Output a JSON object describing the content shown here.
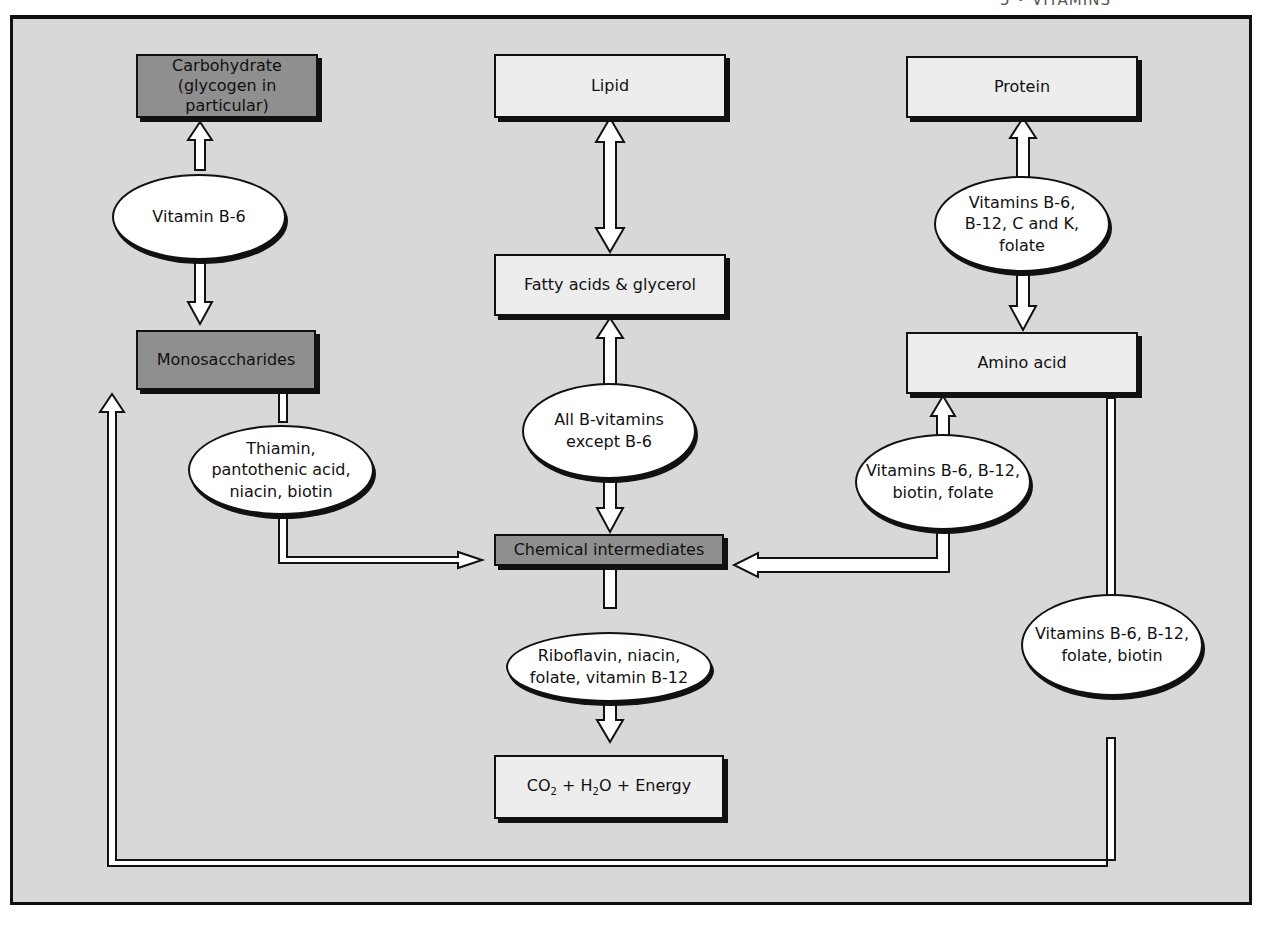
{
  "running_head": "5 • VITAMINS",
  "colors": {
    "panel_background": "#d8d8d8",
    "dark_box": "#8f8f8f",
    "light_box": "#ededed",
    "oval": "#ffffff",
    "outline": "#111111"
  },
  "boxes": {
    "carbohydrate": "Carbohydrate\n(glycogen in particular)",
    "carbohydrate_line1": "Carbohydrate",
    "carbohydrate_line2": "(glycogen in particular)",
    "lipid": "Lipid",
    "protein": "Protein",
    "monosaccharides": "Monosaccharides",
    "fatty_acids": "Fatty acids & glycerol",
    "amino_acid": "Amino acid",
    "chemical_intermediates": "Chemical intermediates",
    "end_products": {
      "co": "CO",
      "co_sub": "2",
      "plus1": " + H",
      "h_sub": "2",
      "rest": "O + Energy"
    }
  },
  "ovals": {
    "carb_monosaccharide": "Vitamin B-6",
    "mono_to_intermediates": "Thiamin,\npantothenic acid,\nniacin, biotin",
    "lipid_to_intermediates": "All B-vitamins\nexcept B-6",
    "intermediates_to_energy": "Riboflavin, niacin,\nfolate, vitamin B-12",
    "protein_amino": "Vitamins B-6,\nB-12, C and K,\nfolate",
    "amino_to_intermediates": "Vitamins B-6, B-12,\nbiotin, folate",
    "amino_to_monosaccharides": "Vitamins B-6, B-12,\nfolate, biotin"
  }
}
